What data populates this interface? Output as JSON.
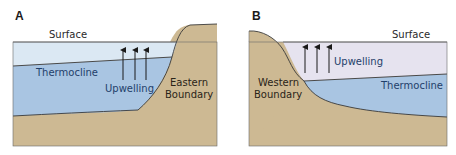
{
  "panels": [
    {
      "id": "A",
      "label": "A",
      "surface_label": "Surface",
      "thermocline_label": "Thermocline",
      "upwelling_label": "Upwelling",
      "boundary_line1": "Eastern",
      "boundary_line2": "Boundary",
      "arrow_count": 3
    },
    {
      "id": "B",
      "label": "B",
      "surface_label": "Surface",
      "thermocline_label": "Thermocline",
      "upwelling_label": "Upwelling",
      "boundary_line1": "Western",
      "boundary_line2": "Boundary",
      "arrow_count": 3
    }
  ],
  "colors": {
    "surface_water_A": "#dbe8f3",
    "surface_water_B": "#e6e3ef",
    "deep_water": "#a9c5e2",
    "land": "#cdb993",
    "outline": "#3a3a3a",
    "arrow": "#1a1a1a"
  }
}
